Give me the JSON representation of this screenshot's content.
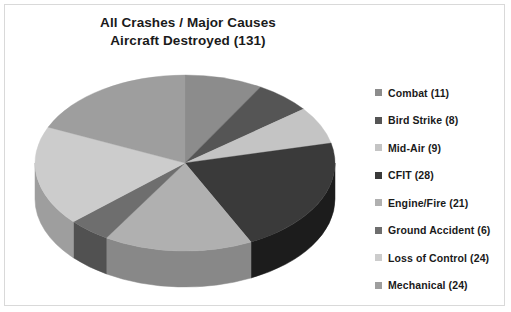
{
  "chart": {
    "title_line1": "All Crashes / Major Causes",
    "title_line2": "Aircraft Destroyed (131)"
  },
  "legend": {
    "items": [
      {
        "label": "Combat (11)",
        "color": "#8c8c8c"
      },
      {
        "label": "Bird Strike (8)",
        "color": "#555555"
      },
      {
        "label": "Mid-Air (9)",
        "color": "#c4c4c4"
      },
      {
        "label": "CFIT (28)",
        "color": "#3a3a3a"
      },
      {
        "label": "Engine/Fire (21)",
        "color": "#b0b0b0"
      },
      {
        "label": "Ground Accident (6)",
        "color": "#6e6e6e"
      },
      {
        "label": "Loss of Control (24)",
        "color": "#cccccc"
      },
      {
        "label": "Mechanical (24)",
        "color": "#9e9e9e"
      }
    ]
  },
  "chart_data": {
    "type": "pie",
    "title": "All Crashes / Major Causes Aircraft Destroyed (131)",
    "total": 131,
    "unit": "aircraft destroyed",
    "three_d": true,
    "start_angle_deg": 0,
    "direction": "clockwise",
    "legend_position": "right",
    "grid": false,
    "categories": [
      "Combat",
      "Bird Strike",
      "Mid-Air",
      "CFIT",
      "Engine/Fire",
      "Ground Accident",
      "Loss of Control",
      "Mechanical"
    ],
    "values": [
      11,
      8,
      9,
      28,
      21,
      6,
      24,
      24
    ],
    "labels": [
      "Combat (11)",
      "Bird Strike (8)",
      "Mid-Air (9)",
      "CFIT (28)",
      "Engine/Fire (21)",
      "Ground Accident (6)",
      "Loss of Control (24)",
      "Mechanical (24)"
    ],
    "colors": [
      "#8c8c8c",
      "#555555",
      "#c4c4c4",
      "#3a3a3a",
      "#b0b0b0",
      "#6e6e6e",
      "#cccccc",
      "#9e9e9e"
    ],
    "side_colors": [
      "#6b6b6b",
      "#3d3d3d",
      "#969696",
      "#1c1c1c",
      "#888888",
      "#515151",
      "#9e9e9e",
      "#777777"
    ]
  }
}
